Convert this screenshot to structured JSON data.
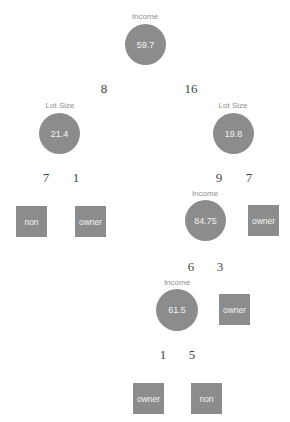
{
  "tree": {
    "root": {
      "variable": "Income",
      "split": "59.7"
    },
    "left_count": "8",
    "right_count": "16",
    "left_node": {
      "variable": "Lot Size",
      "split": "21.4"
    },
    "left_left_count": "7",
    "left_right_count": "1",
    "left_left_leaf": "non",
    "left_right_leaf": "owner",
    "right_node": {
      "variable": "Lot Size",
      "split": "19.8"
    },
    "right_left_count": "9",
    "right_right_count": "7",
    "right_left_node": {
      "variable": "Income",
      "split": "84.75"
    },
    "right_right_leaf": "owner",
    "rl_left_count": "6",
    "rl_right_count": "3",
    "rl_left_node": {
      "variable": "Income",
      "split": "61.5"
    },
    "rl_right_leaf": "owner",
    "rll_left_count": "1",
    "rll_right_count": "5",
    "rll_left_leaf": "owner",
    "rll_right_leaf": "non"
  }
}
